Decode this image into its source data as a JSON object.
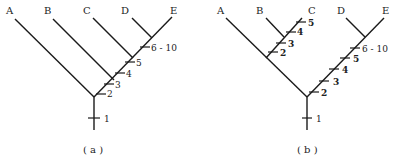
{
  "panel_a": {
    "caption": "( a )",
    "taxa": [
      "A",
      "B",
      "C",
      "D",
      "E"
    ],
    "ticks": [
      "1",
      "2",
      "3",
      "4",
      "5",
      "6 - 10"
    ]
  },
  "panel_b": {
    "caption": "( b )",
    "taxa": [
      "A",
      "B",
      "C",
      "D",
      "E"
    ],
    "ticks_trunk": [
      "1"
    ],
    "ticks_left_clade": [
      "2",
      "3",
      "4",
      "5"
    ],
    "ticks_right_clade": [
      "2",
      "3",
      "4",
      "5",
      "6 - 10"
    ]
  }
}
